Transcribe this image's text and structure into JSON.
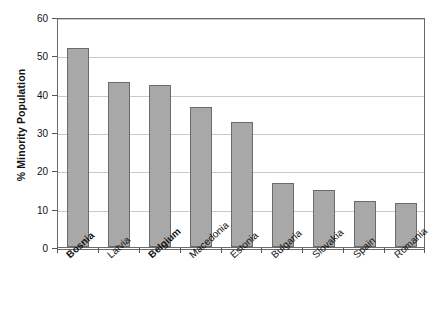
{
  "chart_data": {
    "type": "bar",
    "title": "",
    "xlabel": "",
    "ylabel": "% Minority Population",
    "ylim": [
      0,
      60
    ],
    "yticks": [
      0,
      10,
      20,
      30,
      40,
      50,
      60
    ],
    "grid": true,
    "legend": false,
    "legend_position": "none",
    "orientation": "vertical",
    "bar_color": "#a8a8a8",
    "bar_edge_color": "#6b6b6b",
    "gridline_color": "#c9c9c9",
    "axis_color": "#6a6a6a",
    "background_color": "#ffffff",
    "categories": [
      "Bosnia",
      "Latvia",
      "Belgium",
      "Macedonia",
      "Estonia",
      "Bulgaria",
      "Slovakia",
      "Spain",
      "Romania"
    ],
    "values": [
      52,
      43,
      42.2,
      36.4,
      32.5,
      16.8,
      15,
      12,
      11.5
    ],
    "emphasized_categories": [
      "Bosnia",
      "Belgium"
    ],
    "tick_labels": {
      "y": [
        "0",
        "10",
        "20",
        "30",
        "40",
        "50",
        "60"
      ],
      "x": [
        "Bosnia",
        "Latvia",
        "Belgium",
        "Macedonia",
        "Estonia",
        "Bulgaria",
        "Slovakia",
        "Spain",
        "Romania"
      ]
    }
  },
  "axes": {
    "y_title": "% Minority Population"
  }
}
